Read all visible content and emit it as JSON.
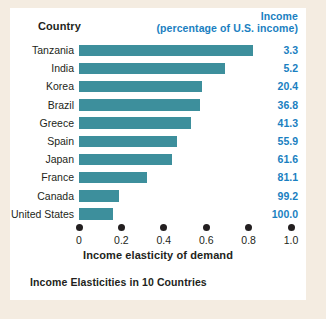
{
  "header": {
    "country_label": "Country",
    "income_line1": "Income",
    "income_line2": "(percentage of U.S. income)"
  },
  "axis": {
    "title": "Income elasticity of demand",
    "ticks": [
      "0",
      "0.2",
      "0.4",
      "0.6",
      "0.8",
      "1.0"
    ]
  },
  "caption": "Income Elasticities in 10 Countries",
  "colors": {
    "bar": "#3d8f9c",
    "value_text": "#1a7fc1",
    "text": "#231f20",
    "panel": "#ffffff",
    "page": "#f4ece1"
  },
  "chart_data": {
    "type": "bar",
    "orientation": "horizontal",
    "title": "Income Elasticities in 10 Countries",
    "xlabel": "Income elasticity of demand",
    "ylabel": "Country",
    "xlim": [
      0,
      1.0
    ],
    "xticks": [
      0,
      0.2,
      0.4,
      0.6,
      0.8,
      1.0
    ],
    "grid": false,
    "legend": false,
    "categories": [
      "Tanzania",
      "India",
      "Korea",
      "Brazil",
      "Greece",
      "Spain",
      "Japan",
      "France",
      "Canada",
      "United States"
    ],
    "values": [
      0.82,
      0.69,
      0.58,
      0.57,
      0.53,
      0.46,
      0.44,
      0.32,
      0.19,
      0.16
    ],
    "series": [
      {
        "name": "Income elasticity of demand",
        "values": [
          0.82,
          0.69,
          0.58,
          0.57,
          0.53,
          0.46,
          0.44,
          0.32,
          0.19,
          0.16
        ]
      }
    ],
    "annotations": {
      "column_header": "Income (percentage of U.S. income)",
      "income_percent_of_us": [
        3.3,
        5.2,
        20.4,
        36.8,
        41.3,
        55.9,
        61.6,
        81.1,
        99.2,
        100.0
      ]
    }
  },
  "rows": [
    {
      "country": "Tanzania",
      "elasticity": 0.82,
      "income": "3.3"
    },
    {
      "country": "India",
      "elasticity": 0.69,
      "income": "5.2"
    },
    {
      "country": "Korea",
      "elasticity": 0.58,
      "income": "20.4"
    },
    {
      "country": "Brazil",
      "elasticity": 0.57,
      "income": "36.8"
    },
    {
      "country": "Greece",
      "elasticity": 0.53,
      "income": "41.3"
    },
    {
      "country": "Spain",
      "elasticity": 0.46,
      "income": "55.9"
    },
    {
      "country": "Japan",
      "elasticity": 0.44,
      "income": "61.6"
    },
    {
      "country": "France",
      "elasticity": 0.32,
      "income": "81.1"
    },
    {
      "country": "Canada",
      "elasticity": 0.19,
      "income": "99.2"
    },
    {
      "country": "United States",
      "elasticity": 0.16,
      "income": "100.0"
    }
  ]
}
